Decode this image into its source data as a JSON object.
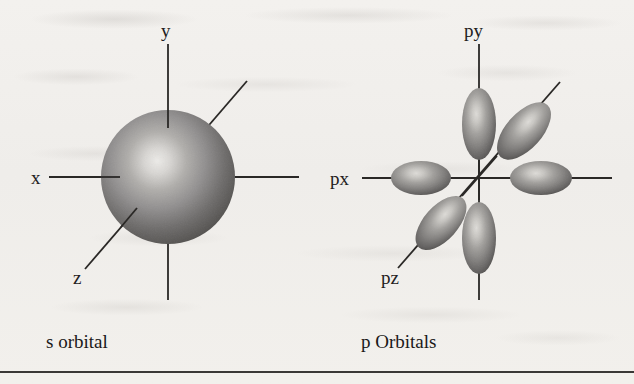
{
  "figure": {
    "background_color": "#f1efec",
    "ink_color": "#222020",
    "rule_color": "#3a3836"
  },
  "s_orbital_panel": {
    "caption": "s orbital",
    "axis_labels": {
      "x": "x",
      "y": "y",
      "z": "z"
    },
    "shape": "sphere",
    "sphere": {
      "center_x": 168,
      "center_y": 177,
      "radius": 67,
      "highlight_color": "#e8e6e2",
      "mid_color": "#8d8b88",
      "edge_color": "#4c4a48"
    }
  },
  "p_orbitals_panel": {
    "caption": "p Orbitals",
    "axis_labels": {
      "px": "px",
      "py": "py",
      "pz": "pz"
    },
    "shape": "six-lobes",
    "origin_x": 479,
    "origin_y": 178,
    "lobes": [
      {
        "name": "py-positive",
        "cx": 479,
        "cy": 124,
        "rx": 17,
        "ry": 36,
        "rotation": 0
      },
      {
        "name": "py-negative",
        "cx": 479,
        "cy": 238,
        "rx": 17,
        "ry": 36,
        "rotation": 0
      },
      {
        "name": "px-negative",
        "cx": 421,
        "cy": 178,
        "rx": 30,
        "ry": 17,
        "rotation": 0
      },
      {
        "name": "px-positive",
        "cx": 541,
        "cy": 178,
        "rx": 31,
        "ry": 17,
        "rotation": 0
      },
      {
        "name": "pz-positive",
        "cx": 524,
        "cy": 131,
        "rx": 18,
        "ry": 35,
        "rotation": 42
      },
      {
        "name": "pz-negative",
        "cx": 441,
        "cy": 223,
        "rx": 17,
        "ry": 33,
        "rotation": 42
      }
    ],
    "lobe_colors": {
      "highlight_color": "#d6d4d0",
      "mid_color": "#8a8885",
      "edge_color": "#4a4846"
    }
  }
}
